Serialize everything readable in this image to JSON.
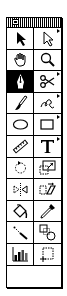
{
  "palette": {
    "title": "",
    "tools": [
      {
        "name": "selection-tool",
        "icon": "arrow-filled-icon",
        "selected": false,
        "has_submenu": false
      },
      {
        "name": "direct-selection-tool",
        "icon": "arrow-hollow-icon",
        "selected": false,
        "has_submenu": true
      },
      {
        "name": "hand-tool",
        "icon": "hand-icon",
        "selected": false,
        "has_submenu": false
      },
      {
        "name": "zoom-tool",
        "icon": "magnifier-icon",
        "selected": false,
        "has_submenu": false
      },
      {
        "name": "pen-tool",
        "icon": "pen-nib-icon",
        "selected": true,
        "has_submenu": false
      },
      {
        "name": "scissors-tool",
        "icon": "scissors-icon",
        "selected": false,
        "has_submenu": true
      },
      {
        "name": "brush-tool",
        "icon": "brush-icon",
        "selected": false,
        "has_submenu": false
      },
      {
        "name": "freehand-tool",
        "icon": "freehand-squiggle-icon",
        "selected": false,
        "has_submenu": true
      },
      {
        "name": "oval-tool",
        "icon": "ellipse-icon",
        "selected": false,
        "has_submenu": false
      },
      {
        "name": "rectangle-tool",
        "icon": "rectangle-icon",
        "selected": false,
        "has_submenu": true
      },
      {
        "name": "measure-tool",
        "icon": "ruler-icon",
        "selected": false,
        "has_submenu": false
      },
      {
        "name": "type-tool",
        "icon": "type-t-icon",
        "selected": false,
        "has_submenu": true
      },
      {
        "name": "rotate-tool",
        "icon": "rotate-icon",
        "selected": false,
        "has_submenu": false
      },
      {
        "name": "scale-tool",
        "icon": "scale-icon",
        "selected": false,
        "has_submenu": false
      },
      {
        "name": "reflect-tool",
        "icon": "reflect-icon",
        "selected": false,
        "has_submenu": false
      },
      {
        "name": "shear-tool",
        "icon": "shear-icon",
        "selected": false,
        "has_submenu": false
      },
      {
        "name": "paint-bucket-tool",
        "icon": "paint-bucket-icon",
        "selected": false,
        "has_submenu": false
      },
      {
        "name": "eyedropper-tool",
        "icon": "eyedropper-icon",
        "selected": false,
        "has_submenu": false
      },
      {
        "name": "blend-tool",
        "icon": "blend-line-icon",
        "selected": false,
        "has_submenu": false
      },
      {
        "name": "shape-blend-tool",
        "icon": "square-circle-blend-icon",
        "selected": false,
        "has_submenu": false
      },
      {
        "name": "graph-tool",
        "icon": "bar-graph-icon",
        "selected": false,
        "has_submenu": false
      },
      {
        "name": "page-tool",
        "icon": "page-crop-icon",
        "selected": false,
        "has_submenu": false
      }
    ]
  }
}
